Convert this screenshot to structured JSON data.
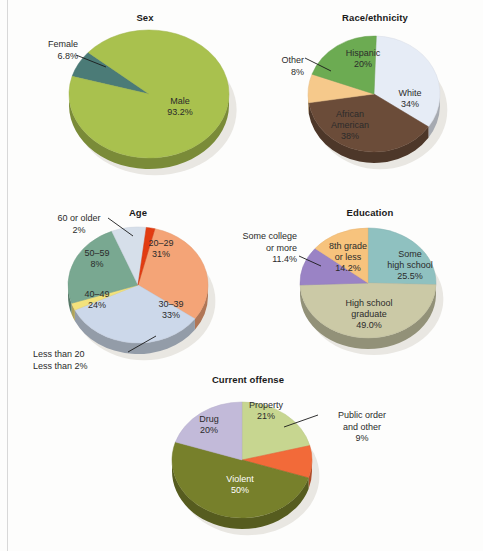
{
  "figure": {
    "background_color": "#fdfdfc",
    "rule_color": "#d8d8d8"
  },
  "chart_data": [
    {
      "id": "sex",
      "type": "pie",
      "title": "Sex",
      "xlabel": "",
      "ylabel": "",
      "legend": "none (slices labeled in place)",
      "grid": false,
      "categories": [
        "Male",
        "Female"
      ],
      "values": [
        93.2,
        6.8
      ],
      "value_labels": [
        "93.2%",
        "6.8%"
      ],
      "colors": [
        "#a9c14e",
        "#4b7b77"
      ],
      "labels": [
        {
          "name": "Male",
          "value": "93.2%",
          "placement": "inside",
          "color": "#2b2b2b"
        },
        {
          "name": "Female",
          "value": "6.8%",
          "placement": "callout",
          "color": "#2b2b2b"
        }
      ]
    },
    {
      "id": "race_ethnicity",
      "type": "pie",
      "title": "Race/ethnicity",
      "xlabel": "",
      "ylabel": "",
      "legend": "none (slices labeled in place)",
      "grid": false,
      "categories": [
        "White",
        "African American",
        "Other",
        "Hispanic"
      ],
      "values": [
        34,
        38,
        8,
        20
      ],
      "value_labels": [
        "34%",
        "38%",
        "8%",
        "20%"
      ],
      "colors": [
        "#e6ecf6",
        "#6b4c39",
        "#f6c98b",
        "#6cab52"
      ],
      "labels": [
        {
          "name": "White",
          "value": "34%",
          "placement": "inside",
          "color": "#2b2b2b"
        },
        {
          "name": "African American",
          "value": "38%",
          "placement": "inside",
          "color": "#ffffff"
        },
        {
          "name": "Other",
          "value": "8%",
          "placement": "callout",
          "color": "#2b2b2b"
        },
        {
          "name": "Hispanic",
          "value": "20%",
          "placement": "inside",
          "color": "#2b2b2b"
        }
      ]
    },
    {
      "id": "age",
      "type": "pie",
      "title": "Age",
      "xlabel": "",
      "ylabel": "",
      "legend": "none (slices labeled in place)",
      "grid": false,
      "categories": [
        "20–29",
        "30–39",
        "Less than 20",
        "40–49",
        "50–59",
        "60 or older"
      ],
      "values": [
        31,
        33,
        2,
        24,
        8,
        2
      ],
      "value_labels": [
        "31%",
        "33%",
        "Less than 2%",
        "24%",
        "8%",
        "2%"
      ],
      "colors": [
        "#f4a477",
        "#ccd8ea",
        "#f3e27c",
        "#79a891",
        "#d6dfea",
        "#e23c11"
      ],
      "labels": [
        {
          "name": "20–29",
          "value": "31%",
          "placement": "inside",
          "color": "#2b2b2b"
        },
        {
          "name": "30–39",
          "value": "33%",
          "placement": "inside",
          "color": "#2b2b2b"
        },
        {
          "name": "Less than 20",
          "value": "Less than 2%",
          "placement": "callout",
          "color": "#2b2b2b"
        },
        {
          "name": "40–49",
          "value": "24%",
          "placement": "inside",
          "color": "#2b2b2b"
        },
        {
          "name": "50–59",
          "value": "8%",
          "placement": "inside",
          "color": "#2b2b2b"
        },
        {
          "name": "60 or older",
          "value": "2%",
          "placement": "callout",
          "color": "#2b2b2b"
        }
      ]
    },
    {
      "id": "education",
      "type": "pie",
      "title": "Education",
      "xlabel": "",
      "ylabel": "",
      "legend": "none (slices labeled in place)",
      "grid": false,
      "categories": [
        "Some high school",
        "High school graduate",
        "Some college or more",
        "8th grade or less"
      ],
      "values": [
        25.5,
        49.0,
        11.4,
        14.2
      ],
      "value_labels": [
        "25.5%",
        "49.0%",
        "11.4%",
        "14.2%"
      ],
      "colors": [
        "#8fc1c0",
        "#cbc9a6",
        "#9a83c5",
        "#f7c37d"
      ],
      "labels": [
        {
          "name": "Some high school",
          "value": "25.5%",
          "placement": "inside",
          "color": "#2b2b2b"
        },
        {
          "name": "High school graduate",
          "value": "49.0%",
          "placement": "inside",
          "color": "#2b2b2b"
        },
        {
          "name": "Some college or more",
          "value": "11.4%",
          "placement": "callout",
          "color": "#2b2b2b"
        },
        {
          "name": "8th grade or less",
          "value": "14.2%",
          "placement": "inside",
          "color": "#2b2b2b"
        }
      ]
    },
    {
      "id": "current_offense",
      "type": "pie",
      "title": "Current offense",
      "xlabel": "",
      "ylabel": "",
      "legend": "none (slices labeled in place)",
      "grid": false,
      "categories": [
        "Property",
        "Public order and other",
        "Violent",
        "Drug"
      ],
      "values": [
        21,
        9,
        50,
        20
      ],
      "value_labels": [
        "21%",
        "9%",
        "50%",
        "20%"
      ],
      "colors": [
        "#c7d690",
        "#f26a39",
        "#77802b",
        "#c2bad9"
      ],
      "labels": [
        {
          "name": "Property",
          "value": "21%",
          "placement": "inside",
          "color": "#2b2b2b"
        },
        {
          "name": "Public order and other",
          "value": "9%",
          "placement": "callout",
          "color": "#2b2b2b"
        },
        {
          "name": "Violent",
          "value": "50%",
          "placement": "inside",
          "color": "#ffffff"
        },
        {
          "name": "Drug",
          "value": "20%",
          "placement": "inside",
          "color": "#2b2b2b"
        }
      ]
    }
  ],
  "charts": {
    "sex": {
      "title": "Sex",
      "male_name": "Male",
      "male_value": "93.2%",
      "female_name": "Female",
      "female_value": "6.8%"
    },
    "race": {
      "title": "Race/ethnicity",
      "white_name": "White",
      "white_value": "34%",
      "african_name_line1": "African",
      "african_name_line2": "American",
      "african_value": "38%",
      "other_name": "Other",
      "other_value": "8%",
      "hispanic_name": "Hispanic",
      "hispanic_value": "20%"
    },
    "age": {
      "title": "Age",
      "a2029_name": "20–29",
      "a2029_value": "31%",
      "a3039_name": "30–39",
      "a3039_value": "33%",
      "a4049_name": "40–49",
      "a4049_value": "24%",
      "a5059_name": "50–59",
      "a5059_value": "8%",
      "a60_name": "60 or older",
      "a60_value": "2%",
      "under20_name": "Less than 20",
      "under20_value": "Less than 2%"
    },
    "education": {
      "title": "Education",
      "somehs_name_line1": "Some",
      "somehs_name_line2": "high school",
      "somehs_value": "25.5%",
      "hsgrad_name_line1": "High school",
      "hsgrad_name_line2": "graduate",
      "hsgrad_value": "49.0%",
      "college_name_line1": "Some college",
      "college_name_line2": "or more",
      "college_value": "11.4%",
      "eighth_name_line1": "8th grade",
      "eighth_name_line2": "or less",
      "eighth_value": "14.2%"
    },
    "offense": {
      "title": "Current offense",
      "property_name": "Property",
      "property_value": "21%",
      "public_name_line1": "Public order",
      "public_name_line2": "and other",
      "public_value": "9%",
      "violent_name": "Violent",
      "violent_value": "50%",
      "drug_name": "Drug",
      "drug_value": "20%"
    }
  }
}
